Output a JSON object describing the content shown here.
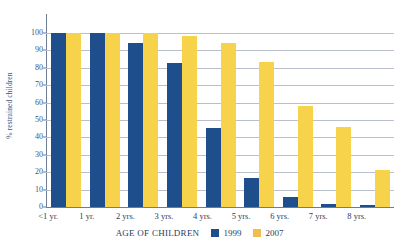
{
  "chart_data": {
    "type": "bar",
    "title": "",
    "xlabel": "AGE OF CHILDREN",
    "ylabel": "% restrained children",
    "ylim": [
      0,
      100
    ],
    "ytick_step": 10,
    "yticks": [
      0,
      10,
      20,
      30,
      40,
      50,
      60,
      70,
      80,
      90,
      100
    ],
    "ytick_labels": [
      "0",
      "10",
      "20",
      "30",
      "40",
      "50",
      "60",
      "70",
      "80",
      "90",
      "100"
    ],
    "grid": true,
    "grid_axis": "y",
    "legend_position": "bottom",
    "categories": [
      "<1 yr.",
      "1 yr.",
      "2 yrs.",
      "3 yrs.",
      "4 yrs.",
      "5 yrs.",
      "6 yrs.",
      "7 yrs.",
      "8 yrs."
    ],
    "series": [
      {
        "name": "1999",
        "color": "#1F4E8C",
        "values": [
          100,
          100,
          94,
          83,
          45.5,
          16.5,
          5.5,
          2,
          1
        ]
      },
      {
        "name": "2007",
        "color": "#F6D34A",
        "legend_color": "#F3BC4E",
        "values": [
          100,
          100,
          100,
          98,
          94.5,
          83.5,
          58,
          46,
          21.5
        ]
      }
    ]
  },
  "colors": {
    "series_1999": "#1F4E8C",
    "series_2007": "#F6D34A",
    "axis": "#6F7C96",
    "gridline": "#B9BFCB",
    "text": "#2C3C60",
    "background": "#FFFFFF"
  }
}
